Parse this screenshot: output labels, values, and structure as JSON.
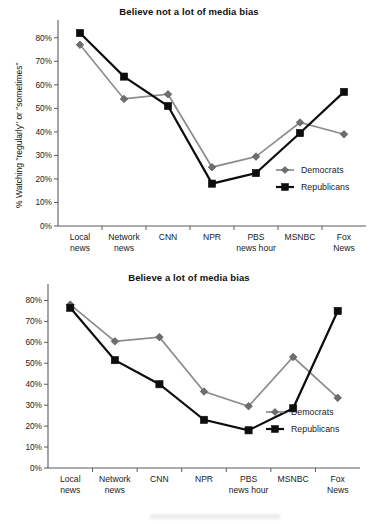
{
  "figure": {
    "width": 378,
    "height": 524,
    "background": "#ffffff"
  },
  "chart_data": [
    {
      "type": "line",
      "title": "Believe not a lot of media bias",
      "xlabel": "",
      "ylabel": "% Watching \"regularly\" or \"sometimes\"",
      "categories": [
        "Local news",
        "Network news",
        "CNN",
        "NPR",
        "PBS news hour",
        "MSNBC",
        "Fox News"
      ],
      "category_lines": [
        [
          "Local",
          "news"
        ],
        [
          "Network",
          "news"
        ],
        [
          "CNN"
        ],
        [
          "NPR"
        ],
        [
          "PBS",
          "news hour"
        ],
        [
          "MSNBC"
        ],
        [
          "Fox",
          "News"
        ]
      ],
      "ylim": [
        0,
        85
      ],
      "yticks": [
        0,
        10,
        20,
        30,
        40,
        50,
        60,
        70,
        80
      ],
      "ytick_labels": [
        "0%",
        "10%",
        "20%",
        "30%",
        "40%",
        "50%",
        "60%",
        "70%",
        "80%"
      ],
      "grid": false,
      "legend_position": "right-inside",
      "series": [
        {
          "name": "Democrats",
          "color": "#8c8c8c",
          "marker": "diamond",
          "values": [
            77,
            54,
            56,
            25,
            29.5,
            44,
            39
          ]
        },
        {
          "name": "Republicans",
          "color": "#0d0d0d",
          "marker": "square",
          "values": [
            82,
            63.5,
            51,
            18,
            22.5,
            39.5,
            57
          ]
        }
      ]
    },
    {
      "type": "line",
      "title": "Believe a lot of media bias",
      "xlabel": "",
      "ylabel": "",
      "categories": [
        "Local news",
        "Network news",
        "CNN",
        "NPR",
        "PBS news hour",
        "MSNBC",
        "Fox News"
      ],
      "category_lines": [
        [
          "Local",
          "news"
        ],
        [
          "Network",
          "news"
        ],
        [
          "CNN"
        ],
        [
          "NPR"
        ],
        [
          "PBS",
          "news hour"
        ],
        [
          "MSNBC"
        ],
        [
          "Fox",
          "News"
        ]
      ],
      "ylim": [
        0,
        85
      ],
      "yticks": [
        0,
        10,
        20,
        30,
        40,
        50,
        60,
        70,
        80
      ],
      "ytick_labels": [
        "0%",
        "10%",
        "20%",
        "30%",
        "40%",
        "50%",
        "60%",
        "70%",
        "80%"
      ],
      "grid": false,
      "legend_position": "right-inside",
      "series": [
        {
          "name": "Democrats",
          "color": "#8c8c8c",
          "marker": "diamond",
          "values": [
            78,
            60.5,
            62.5,
            36.5,
            29.5,
            53,
            33.5
          ]
        },
        {
          "name": "Republicans",
          "color": "#0d0d0d",
          "marker": "square",
          "values": [
            76.5,
            51.5,
            40,
            23,
            18,
            28.5,
            75
          ]
        }
      ]
    }
  ]
}
